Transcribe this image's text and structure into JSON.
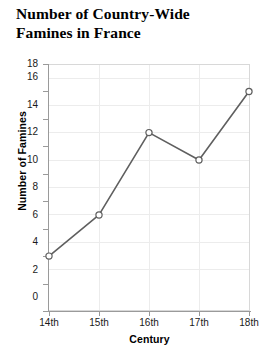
{
  "chart_data": {
    "type": "line",
    "title": "Number of Country-Wide Famines in France",
    "title_lines": [
      "Number of Country-Wide",
      "Famines in France"
    ],
    "xlabel": "Century",
    "ylabel": "Number of Famines",
    "categories": [
      "14th",
      "15th",
      "16th",
      "17th",
      "18th"
    ],
    "values": [
      4,
      7,
      13,
      11,
      16
    ],
    "series": [
      {
        "name": "Famines",
        "values": [
          4,
          7,
          13,
          11,
          16
        ]
      }
    ],
    "points": [
      {
        "x": "14th",
        "y": 4
      },
      {
        "x": "15th",
        "y": 7
      },
      {
        "x": "16th",
        "y": 13
      },
      {
        "x": "17th",
        "y": 11
      },
      {
        "x": "18th",
        "y": 16
      }
    ],
    "ylim": [
      0,
      18
    ],
    "yticks": [
      0,
      2,
      4,
      6,
      8,
      10,
      12,
      14,
      16,
      18
    ],
    "ytick_labels": [
      "0",
      "2",
      "4",
      "6",
      "8",
      "10",
      "12",
      "14",
      "16",
      "18"
    ],
    "xtick_labels": [
      "14th",
      "15th",
      "16th",
      "17th",
      "18th"
    ],
    "grid": true,
    "legend": false,
    "marker": "open-circle",
    "line_color": "#5f5f5f",
    "marker_fill": "#ffffff",
    "marker_stroke": "#5f5f5f",
    "grid_color": "#ececec",
    "axis_color": "#9a9a9a",
    "background": "#ffffff"
  }
}
